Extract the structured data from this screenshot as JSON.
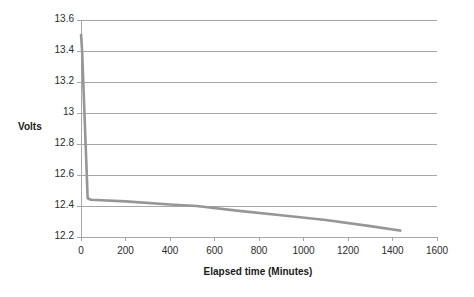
{
  "chart_data": {
    "type": "line",
    "title": "",
    "xlabel": "Elapsed time (Minutes)",
    "ylabel": "Volts",
    "xlim": [
      0,
      1600
    ],
    "ylim": [
      12.2,
      13.6
    ],
    "x_ticks": [
      "0",
      "200",
      "400",
      "600",
      "800",
      "1000",
      "1200",
      "1400",
      "1600"
    ],
    "x_tick_values": [
      0,
      200,
      400,
      600,
      800,
      1000,
      1200,
      1400,
      1600
    ],
    "y_ticks": [
      "12.2",
      "12.4",
      "12.6",
      "12.8",
      "13",
      "13.2",
      "13.4",
      "13.6"
    ],
    "y_tick_values": [
      12.2,
      12.4,
      12.6,
      12.8,
      13.0,
      13.2,
      13.4,
      13.6
    ],
    "grid": "horizontal",
    "legend": "none",
    "series": [
      {
        "name": "Volts",
        "color": "#969696",
        "x": [
          0,
          5,
          30,
          45,
          200,
          400,
          520,
          700,
          900,
          1100,
          1300,
          1440
        ],
        "values": [
          13.51,
          13.4,
          12.45,
          12.44,
          12.43,
          12.41,
          12.4,
          12.37,
          12.34,
          12.31,
          12.27,
          12.24
        ]
      }
    ]
  },
  "axis_colors": {
    "gridline": "#a6a6a6",
    "axis_line": "#a6a6a6",
    "tick_text": "#2b2b2b",
    "title_text": "#1a1a1a"
  }
}
